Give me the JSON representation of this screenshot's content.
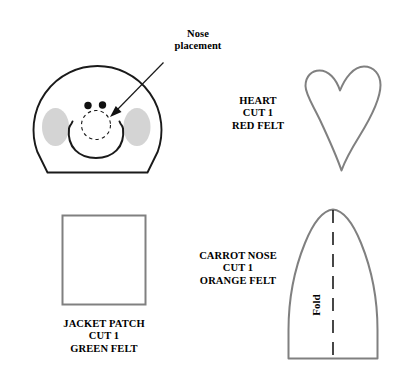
{
  "document": {
    "type": "sewing-pattern-template",
    "title": "Snowman felt pattern pieces",
    "background_color": "#ffffff"
  },
  "colors": {
    "outline_black": "#1a1a1a",
    "outline_gray": "#808080",
    "cheek_gray": "#d4d4d4",
    "text_black": "#000000"
  },
  "annotations": {
    "nose_placement": "Nose\nplacement",
    "fold": "Fold"
  },
  "pieces": [
    {
      "id": "snowman-head",
      "name": "Snowman head placement guide",
      "label": "",
      "features": [
        "dome-outline",
        "left-cheek",
        "right-cheek",
        "left-eye",
        "right-eye",
        "nose-placement-dashed-circle",
        "mouth-curve"
      ]
    },
    {
      "id": "heart",
      "name": "Heart",
      "label": "HEART\nCUT 1\nRED FELT",
      "title": "HEART",
      "quantity": "CUT 1",
      "material": "RED FELT"
    },
    {
      "id": "jacket-patch",
      "name": "Jacket patch",
      "label": "JACKET PATCH\nCUT 1\nGREEN FELT",
      "title": "JACKET PATCH",
      "quantity": "CUT 1",
      "material": "GREEN FELT"
    },
    {
      "id": "carrot-nose",
      "name": "Carrot nose",
      "label": "CARROT NOSE\nCUT 1\nORANGE FELT",
      "title": "CARROT NOSE",
      "quantity": "CUT 1",
      "material": "ORANGE FELT",
      "fold_line": "Fold"
    }
  ]
}
